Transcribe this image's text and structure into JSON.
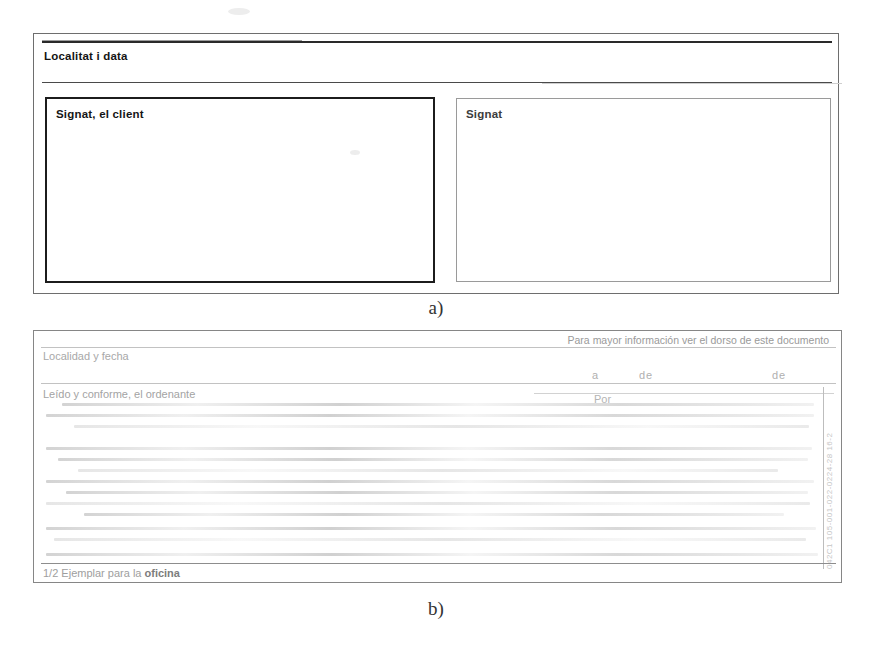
{
  "figure": {
    "caption_a": "a)",
    "caption_b": "b)"
  },
  "panel_a": {
    "language": "Catalan",
    "field_localitat": "Localitat i data",
    "signature_box_client": "Signat, el client",
    "signature_box_plain": "Signat"
  },
  "panel_b": {
    "language": "Spanish",
    "note_reverse": "Para mayor información ver el dorso de este documento",
    "field_localidad": "Localidad y fecha",
    "field_leido": "Leído y conforme, el ordenante",
    "date_a": "a",
    "date_de_1": "de",
    "date_de_2": "de",
    "field_por": "Por",
    "footer": "1/2 Ejemplar para la ",
    "footer_bold": "oficina",
    "side_text": "042C1 105-001-022-0224-28 16-2",
    "body_text_note": "illegible faded scan text"
  },
  "colors": {
    "page_background": "#ffffff",
    "panel_a_border": "#6e6e6e",
    "panel_b_border": "#868686",
    "ink_dark": "#1c1c1c",
    "ink_faded": "#b9b9b9",
    "caption": "#333333"
  }
}
